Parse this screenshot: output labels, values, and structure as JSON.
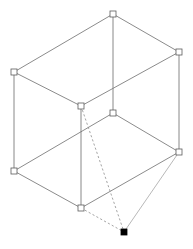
{
  "scene": {
    "title": "3D wireframe box diagram",
    "background_color": "#ffffff",
    "width": 193,
    "height": 249,
    "edge_color": "#6d6d6d",
    "vertex_stroke_color": "#5c5c5c",
    "vertex_fill_color": "#ffffff",
    "selected_vertex_color": "#000000",
    "handle_size": 6
  },
  "vertices": [
    {
      "id": "top-back",
      "name": "vertex-top-back",
      "x": 113,
      "y": 14,
      "state": "open"
    },
    {
      "id": "upper-left",
      "name": "vertex-upper-left",
      "x": 14,
      "y": 72,
      "state": "open"
    },
    {
      "id": "upper-right",
      "name": "vertex-upper-right",
      "x": 179,
      "y": 52,
      "state": "open"
    },
    {
      "id": "upper-front",
      "name": "vertex-upper-front-center",
      "x": 81,
      "y": 106,
      "state": "open"
    },
    {
      "id": "mid-back",
      "name": "vertex-mid-back-center",
      "x": 113,
      "y": 113,
      "state": "open"
    },
    {
      "id": "lower-left",
      "name": "vertex-lower-left",
      "x": 14,
      "y": 171,
      "state": "open"
    },
    {
      "id": "lower-right",
      "name": "vertex-lower-right",
      "x": 179,
      "y": 152,
      "state": "open"
    },
    {
      "id": "lower-front",
      "name": "vertex-lower-front-center",
      "x": 81,
      "y": 208,
      "state": "open"
    },
    {
      "id": "apex",
      "name": "vertex-apex-selected",
      "x": 124,
      "y": 232,
      "state": "filled"
    }
  ],
  "edges": [
    {
      "name": "edge-top-back-to-upper-left",
      "from": "top-back",
      "to": "upper-left",
      "style": "solid"
    },
    {
      "name": "edge-top-back-to-upper-right",
      "from": "top-back",
      "to": "upper-right",
      "style": "solid"
    },
    {
      "name": "edge-upper-left-to-upper-front",
      "from": "upper-left",
      "to": "upper-front",
      "style": "solid"
    },
    {
      "name": "edge-upper-right-to-upper-front",
      "from": "upper-right",
      "to": "upper-front",
      "style": "solid"
    },
    {
      "name": "edge-vertical-top-back",
      "from": "top-back",
      "to": "mid-back",
      "style": "vertical"
    },
    {
      "name": "edge-vertical-upper-left",
      "from": "upper-left",
      "to": "lower-left",
      "style": "vertical"
    },
    {
      "name": "edge-vertical-upper-right",
      "from": "upper-right",
      "to": "lower-right",
      "style": "vertical"
    },
    {
      "name": "edge-vertical-upper-front",
      "from": "upper-front",
      "to": "lower-front",
      "style": "vertical"
    },
    {
      "name": "edge-lower-left-to-mid-back",
      "from": "lower-left",
      "to": "mid-back",
      "style": "solid"
    },
    {
      "name": "edge-mid-back-to-lower-right",
      "from": "mid-back",
      "to": "lower-right",
      "style": "solid"
    },
    {
      "name": "edge-lower-left-to-lower-front",
      "from": "lower-left",
      "to": "lower-front",
      "style": "solid"
    },
    {
      "name": "edge-lower-front-to-lower-right",
      "from": "lower-front",
      "to": "lower-right",
      "style": "solid"
    },
    {
      "name": "edge-upper-front-to-apex",
      "from": "upper-front",
      "to": "apex",
      "style": "dashed"
    },
    {
      "name": "edge-lower-front-to-apex",
      "from": "lower-front",
      "to": "apex",
      "style": "dashed"
    },
    {
      "name": "edge-lower-right-to-apex",
      "from": "lower-right",
      "to": "apex",
      "style": "thin"
    }
  ]
}
